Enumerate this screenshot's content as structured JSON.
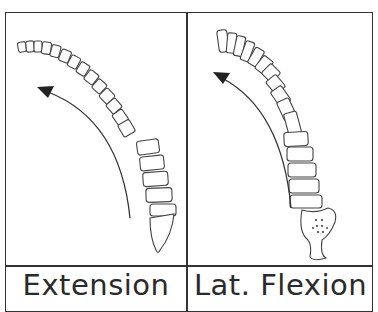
{
  "panels": [
    {
      "label": "Extension",
      "illustration": "spine-extension-lateral-view",
      "arrow_direction": "counter-clockwise up-left"
    },
    {
      "label": "Lat. Flexion",
      "illustration": "spine-lateral-flexion-posterior-view",
      "arrow_direction": "counter-clockwise up-left"
    }
  ],
  "colors": {
    "line": "#333333",
    "background": "#ffffff"
  }
}
